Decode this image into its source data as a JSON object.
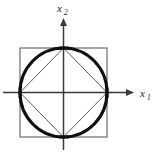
{
  "figure": {
    "name": "norm-balls-diagram",
    "background_color": "#ffffff",
    "width": 160,
    "height": 157
  },
  "axes": {
    "origin": {
      "x": 63,
      "y": 93
    },
    "horizontal": {
      "name": "x1-axis",
      "label_base": "x",
      "label_subscript": "1",
      "color": "#3a3a3a",
      "start_x": 3,
      "end_x": 134,
      "arrow_tip_x": 134,
      "label_x": 141,
      "label_y": 97
    },
    "vertical": {
      "name": "x2-axis",
      "label_base": "x",
      "label_subscript": "2",
      "color": "#3a3a3a",
      "start_y": 150,
      "end_y": 18,
      "arrow_tip_y": 18,
      "label_x": 58,
      "label_y": 12
    }
  },
  "shapes": {
    "square": {
      "name": "outer-square",
      "description": "L-infinity unit ball",
      "left": 20,
      "top": 48,
      "right": 107,
      "bottom": 137,
      "stroke_color": "#777777",
      "stroke_width": 1.3,
      "fill": "none"
    },
    "circle": {
      "name": "inscribed-circle",
      "description": "L2 unit ball",
      "center_x": 63.5,
      "center_y": 92.5,
      "radius_x": 43.5,
      "radius_y": 44.5,
      "stroke_color": "#0f0f0f",
      "stroke_width": 3.1,
      "fill": "none"
    },
    "diamond": {
      "name": "inscribed-diamond",
      "description": "L1 unit ball",
      "points": "63.5,48 107,92.5 63.5,137 20,92.5",
      "stroke_color": "#5a5a5a",
      "stroke_width": 1.0,
      "fill": "none"
    }
  },
  "vertices": [
    {
      "name": "vertex-top",
      "x": 63.5,
      "y": 48
    },
    {
      "name": "vertex-right",
      "x": 107,
      "y": 92.5
    },
    {
      "name": "vertex-bottom",
      "x": 63.5,
      "y": 137
    },
    {
      "name": "vertex-left",
      "x": 20,
      "y": 92.5
    }
  ]
}
